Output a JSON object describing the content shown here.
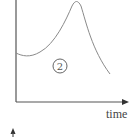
{
  "diagram": {
    "x_axis_label": "time",
    "region_label": "2",
    "curve_description": "starts mid-height, dips slightly, rises to a sharp peak, then decays",
    "colors": {
      "axis": "#555555",
      "curve": "#8a8a8a",
      "text": "#444444"
    }
  }
}
